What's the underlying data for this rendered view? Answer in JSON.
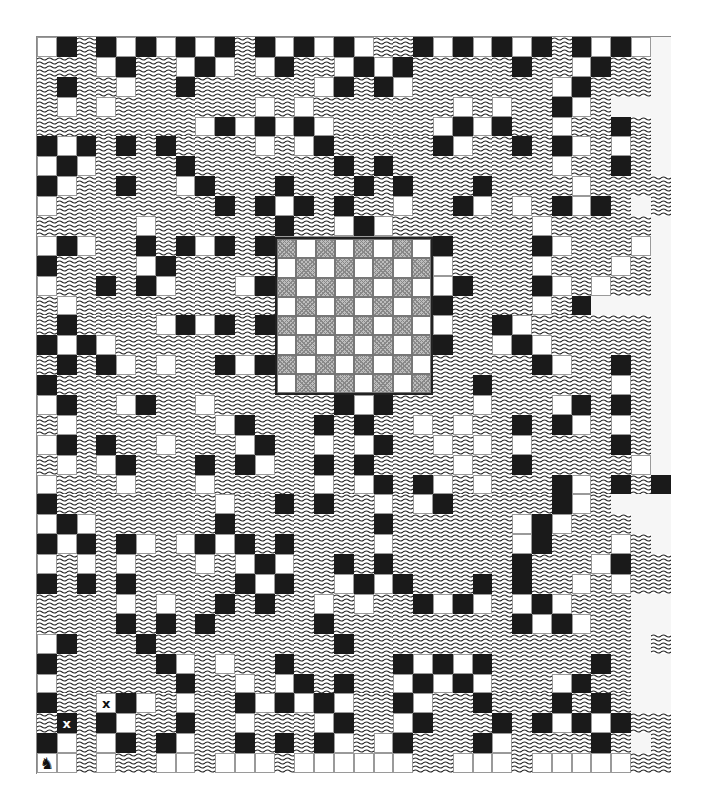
{
  "game": {
    "title": "Knight tour puzzle board",
    "legend": {
      ".": "water",
      "W": "white-tile",
      "B": "black-tile",
      "F": "faded-tile",
      "x": "white-tile-marked-x",
      "X": "black-tile-marked-x",
      "K": "knight-piece"
    },
    "mark_glyph": "x",
    "knight_glyph": "♞",
    "colors": {
      "black": "#1a1a1a",
      "white": "#ffffff",
      "chess_dark": "#bdbdbd",
      "water_line": "#222222"
    },
    "columns": 32,
    "rows_count": 37,
    "rows": [
      "WB.BWBWBWB.BWBWBW..BWBWBWB.BWBWF",
      "...WB..WBW.WB..WBWB.....B..WB..F",
      ".B..W..B......WB.BW.......WB...F",
      ".W.W.......W.W.......W.W..BW.FFF",
      "........WBWBWBW.....WBWB..W..B.F",
      "BWB.B.B....W.WB.....BW..B.BW.W.F",
      "WBW....B.......B.B........W..B.F",
      "BW..B..WB...B...B.B...B....W....",
      "W........B.BWB.B..W..BW.W.BWB.F.",
      ".....W......B..WBW.......W.....F",
      "WBW..B.BWB.BWWWWWWWWB....BW...WF",
      "B....WB.....WWWWWWWWW....W...W.F",
      "W..B.BW...WBWWWWWWWWWB...BW.W..F",
      ".W..........WWWWWWWWB....W.BFFFF",
      ".B....WBWB.BWWWWWWWWW..BW......F",
      "BWBW........WWWWWWWWB..WBW.....F",
      ".B.BW.W..BWBWWWWWWWW.....BW..B.F",
      "B...........WWWWWWWW..B......W.F",
      "WB..WB..W......BWB....W...WB.B.F",
      ".W.......WB...B.B..W.W..B.BW.W.F",
      "WB.B..W...WB..W.WB..W.W.W....B.F",
      ".W.WB...B.BW..B.B....W..B.....WF",
      "W...W...W.....W.WB.BW.W...BW.B.B",
      "B........W..B.B..W.WB.....BW.FFF",
      "WBW......B.......B......WBW...FF",
      "BWB.BW.WBWB.B....W......WB...W.F",
      "W.W.W...W.WBW..B.B......B...WB..",
      "B.B.B.....BWB..WBWB...B.B..W.W..",
      "....W.W..B.B..W.W..BWBW.WBW...FF",
      "....B.B.B.....B.........BWBW..FF",
      "WB...B.........B..............F.",
      "B.....BW.W..B.....BWBWB.....B.FF",
      "W......B..W.WB.B..WBWBW...WB..FF",
      "B..xBW.W..BWBWBW..BW..B...B.B.FF",
      ".X.BW..B..W...WB..WB...B.BWBWB..",
      "BW.WB.BW..B.B.BW.WB...BW....B.F.",
      "KW.W..WW.WWW.WWWWWW..WWW.WWWWW.."
    ],
    "chessboard": {
      "size": 8,
      "top_left": "dark"
    }
  }
}
